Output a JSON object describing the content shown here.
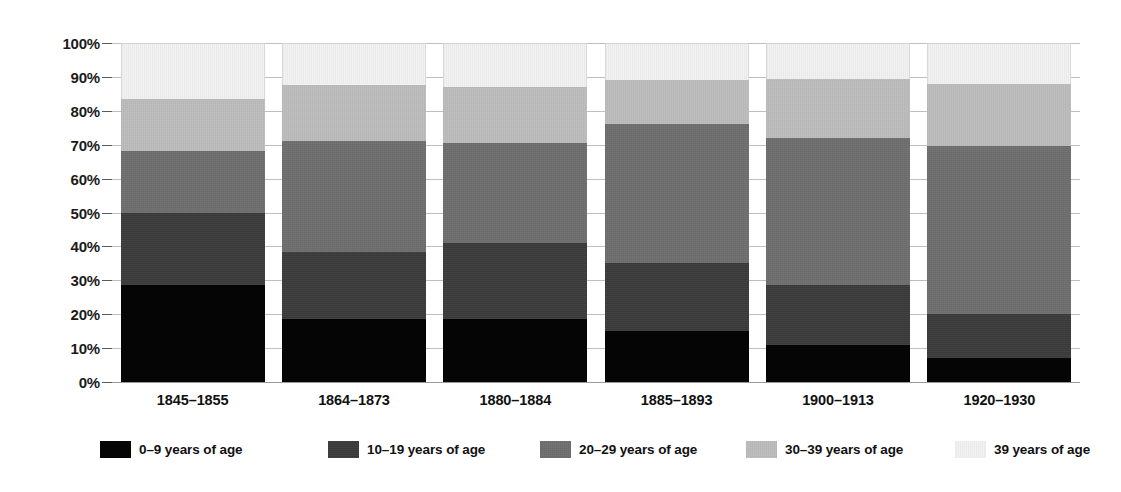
{
  "top_caption": "",
  "axis": {
    "y_ticks": [
      "100%",
      "90%",
      "80%",
      "70%",
      "60%",
      "50%",
      "40%",
      "30%",
      "20%",
      "10%",
      "0%"
    ]
  },
  "legend": {
    "items": [
      {
        "label": "0–9 years of age",
        "color": "#050505",
        "swatch": "legend-swatch-0-9"
      },
      {
        "label": "10–19 years of age",
        "color": "#3a3a3a",
        "swatch": "legend-swatch-10-19"
      },
      {
        "label": "20–29 years of age",
        "color": "#6e6e6e",
        "swatch": "legend-swatch-20-29"
      },
      {
        "label": "30–39 years of age",
        "color": "#bcbcbc",
        "swatch": "legend-swatch-30-39"
      },
      {
        "label": "39 years of age",
        "color": "#f2f2f2",
        "swatch": "legend-swatch-39-plus"
      }
    ]
  },
  "chart_data": {
    "type": "bar",
    "stacked": true,
    "stack_total": 100,
    "title": "",
    "xlabel": "",
    "ylabel": "",
    "ylim": [
      0,
      100
    ],
    "ytick_interval": 10,
    "grid": true,
    "legend_position": "bottom",
    "units": "percent",
    "categories": [
      "1845–1855",
      "1864–1873",
      "1880–1884",
      "1885–1893",
      "1900–1913",
      "1920–1930"
    ],
    "series": [
      {
        "name": "0–9 years of age",
        "color": "#050505",
        "values": [
          28.5,
          18.5,
          18.5,
          15.0,
          11.0,
          7.0
        ]
      },
      {
        "name": "10–19 years of age",
        "color": "#3a3a3a",
        "values": [
          21.5,
          20.0,
          22.5,
          20.0,
          17.5,
          13.0
        ]
      },
      {
        "name": "20–29 years of age",
        "color": "#6e6e6e",
        "values": [
          18.0,
          32.5,
          29.5,
          41.0,
          43.5,
          49.5
        ]
      },
      {
        "name": "30–39 years of age",
        "color": "#bcbcbc",
        "values": [
          15.5,
          16.5,
          16.5,
          13.0,
          17.5,
          18.5
        ]
      },
      {
        "name": "39 years of age",
        "color": "#f2f2f2",
        "values": [
          16.5,
          12.5,
          13.0,
          11.0,
          10.5,
          12.0
        ]
      }
    ],
    "cumulative_tops": [
      [
        28.5,
        50.0,
        68.0,
        83.5,
        100
      ],
      [
        18.5,
        38.5,
        71.0,
        87.5,
        100
      ],
      [
        18.5,
        41.0,
        70.5,
        87.0,
        100
      ],
      [
        15.0,
        35.0,
        76.0,
        89.0,
        100
      ],
      [
        11.0,
        28.5,
        72.0,
        89.5,
        100
      ],
      [
        7.0,
        20.0,
        69.5,
        88.0,
        100
      ]
    ]
  }
}
